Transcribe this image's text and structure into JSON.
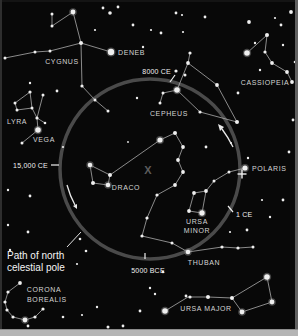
{
  "figure": {
    "kind": "precession-star-map",
    "colors": {
      "background": "#080808",
      "star": "#efefef",
      "line": "#b9b9b9",
      "circle": "#4a4a4a",
      "arrow": "#e8e8e8",
      "pointer": "#e0e0e0",
      "frame_top": "#141414",
      "frame_left": "#2e2e2e",
      "frame_right": "#606060",
      "frame_bottom": "#b5b5b5",
      "frame_bottom_line": "#8c8c8c"
    },
    "pole_circle": {
      "cx": 150,
      "cy": 169,
      "r": 90,
      "stroke_width": 3.5
    },
    "center_mark": {
      "text": "X",
      "x": 148,
      "y": 174
    },
    "polaris_marker": {
      "x": 242,
      "y": 174,
      "arm": 4.5
    },
    "path_label": {
      "line1": "Path of north",
      "line2": "celestial pole",
      "x": 7,
      "y1": 259,
      "y2": 271,
      "pointer": [
        67,
        247,
        81,
        232
      ]
    },
    "date_markers": [
      {
        "label": "8000 CE",
        "x": 171,
        "y": 74,
        "anchor": "end",
        "dot": [
          176,
          71
        ],
        "tick": [
          175,
          75,
          170,
          82
        ]
      },
      {
        "label": "15,000 CE",
        "x": 48,
        "y": 168,
        "anchor": "end",
        "tick": [
          51,
          165,
          59,
          165
        ]
      },
      {
        "label": "1 CE",
        "x": 236,
        "y": 217,
        "anchor": "start",
        "tick": [
          228,
          206,
          233,
          212
        ]
      },
      {
        "label": "5000 BCE",
        "x": 148,
        "y": 273,
        "anchor": "middle",
        "tick": [
          145,
          253,
          145,
          259
        ]
      }
    ],
    "arrows": [
      {
        "shaft": "M67,185 Q70,196 75,205",
        "head": "77,209 77,204 73,206"
      },
      {
        "shaft": "M233,147 Q228,137 222,129",
        "head": "218,124 224,127 220,131"
      }
    ],
    "constellations": [
      {
        "id": "cygnus",
        "labels": [
          {
            "text": "CYGNUS",
            "x": 62,
            "y": 64,
            "anchor": "middle"
          },
          {
            "text": "DENEB",
            "x": 118,
            "y": 55,
            "anchor": "start"
          }
        ],
        "stars": [
          [
            73,
            12,
            2.4
          ],
          [
            52,
            14,
            1.5
          ],
          [
            52,
            26,
            1.5
          ],
          [
            81,
            43,
            2.0
          ],
          [
            111,
            52,
            3.2
          ],
          [
            50,
            51,
            1.5
          ],
          [
            35,
            52,
            1.5
          ],
          [
            5,
            58,
            1.5
          ],
          [
            82,
            86,
            1.6
          ],
          [
            95,
            100,
            1.5
          ],
          [
            108,
            111,
            1.5
          ]
        ],
        "paths": [
          [
            [
              52,
              14
            ],
            [
              52,
              26
            ],
            [
              73,
              12
            ],
            [
              81,
              43
            ],
            [
              111,
              52
            ]
          ],
          [
            [
              5,
              58
            ],
            [
              35,
              52
            ],
            [
              50,
              51
            ],
            [
              81,
              43
            ]
          ],
          [
            [
              81,
              43
            ],
            [
              82,
              86
            ],
            [
              95,
              100
            ],
            [
              108,
              111
            ]
          ]
        ]
      },
      {
        "id": "lyra",
        "labels": [
          {
            "text": "LYRA",
            "x": 17,
            "y": 124,
            "anchor": "middle"
          },
          {
            "text": "VEGA",
            "x": 44,
            "y": 142,
            "anchor": "middle"
          }
        ],
        "stars": [
          [
            30,
            92,
            1.6
          ],
          [
            43,
            95,
            1.5
          ],
          [
            15,
            103,
            1.5
          ],
          [
            17,
            110,
            1.5
          ],
          [
            32,
            108,
            1.5
          ],
          [
            37,
            118,
            1.6
          ],
          [
            45,
            123,
            1.3
          ],
          [
            38,
            130,
            2.8
          ],
          [
            22,
            143,
            1.5
          ]
        ],
        "paths": [
          [
            [
              30,
              92
            ],
            [
              15,
              103
            ],
            [
              17,
              110
            ],
            [
              32,
              108
            ],
            [
              30,
              92
            ]
          ],
          [
            [
              32,
              108
            ],
            [
              37,
              118
            ],
            [
              38,
              130
            ],
            [
              22,
              143
            ]
          ],
          [
            [
              37,
              118
            ],
            [
              45,
              123
            ]
          ],
          [
            [
              43,
              95
            ],
            [
              37,
              118
            ]
          ]
        ]
      },
      {
        "id": "cassiopeia",
        "labels": [
          {
            "text": "CASSIOPEIA",
            "x": 265,
            "y": 85,
            "anchor": "middle"
          }
        ],
        "stars": [
          [
            247,
            53,
            2.8
          ],
          [
            267,
            35,
            2.0
          ],
          [
            265,
            52,
            1.6
          ],
          [
            272,
            63,
            1.9
          ],
          [
            287,
            72,
            1.9
          ],
          [
            292,
            82,
            1.9
          ]
        ],
        "paths": [
          [
            [
              247,
              53
            ],
            [
              267,
              35
            ],
            [
              265,
              52
            ],
            [
              272,
              63
            ],
            [
              287,
              72
            ],
            [
              292,
              82
            ]
          ]
        ]
      },
      {
        "id": "cepheus",
        "labels": [
          {
            "text": "CEPHEUS",
            "x": 169,
            "y": 116,
            "anchor": "middle"
          }
        ],
        "stars": [
          [
            190,
            53,
            1.6
          ],
          [
            188,
            63,
            1.9
          ],
          [
            185,
            75,
            1.5
          ],
          [
            177,
            90,
            2.8
          ],
          [
            217,
            85,
            1.9
          ],
          [
            237,
            122,
            2.0
          ],
          [
            200,
            112,
            1.6
          ],
          [
            163,
            93,
            1.5
          ],
          [
            160,
            103,
            1.5
          ]
        ],
        "paths": [
          [
            [
              190,
              53
            ],
            [
              188,
              63
            ]
          ],
          [
            [
              188,
              63
            ],
            [
              177,
              90
            ],
            [
              200,
              112
            ],
            [
              237,
              122
            ],
            [
              217,
              85
            ],
            [
              188,
              63
            ]
          ],
          [
            [
              177,
              90
            ],
            [
              163,
              93
            ],
            [
              160,
              103
            ]
          ]
        ]
      },
      {
        "id": "draco",
        "labels": [
          {
            "text": "DRACO",
            "x": 126,
            "y": 190,
            "anchor": "middle"
          },
          {
            "text": "THUBAN",
            "x": 204,
            "y": 265,
            "anchor": "middle"
          }
        ],
        "stars": [
          [
            90,
            165,
            2.3
          ],
          [
            110,
            175,
            2.0
          ],
          [
            108,
            185,
            2.3
          ],
          [
            93,
            183,
            2.0
          ],
          [
            160,
            140,
            2.6
          ],
          [
            175,
            133,
            2.0
          ],
          [
            183,
            147,
            1.9
          ],
          [
            178,
            160,
            1.9
          ],
          [
            183,
            172,
            1.9
          ],
          [
            175,
            185,
            1.9
          ],
          [
            157,
            195,
            1.6
          ],
          [
            147,
            218,
            1.6
          ],
          [
            142,
            236,
            1.6
          ],
          [
            172,
            243,
            1.5
          ],
          [
            188,
            252,
            2.3
          ],
          [
            222,
            247,
            1.6
          ],
          [
            238,
            248,
            1.6
          ],
          [
            253,
            247,
            1.5
          ]
        ],
        "paths": [
          [
            [
              90,
              165
            ],
            [
              110,
              175
            ],
            [
              108,
              185
            ],
            [
              93,
              183
            ],
            [
              90,
              165
            ]
          ],
          [
            [
              110,
              175
            ],
            [
              160,
              140
            ],
            [
              175,
              133
            ],
            [
              183,
              147
            ],
            [
              178,
              160
            ],
            [
              183,
              172
            ],
            [
              175,
              185
            ],
            [
              157,
              195
            ],
            [
              147,
              218
            ],
            [
              142,
              236
            ],
            [
              172,
              243
            ],
            [
              188,
              252
            ],
            [
              222,
              247
            ],
            [
              238,
              248
            ],
            [
              253,
              247
            ]
          ]
        ]
      },
      {
        "id": "ursa-minor",
        "labels": [
          {
            "text": "URSA",
            "x": 197,
            "y": 224,
            "anchor": "middle"
          },
          {
            "text": "MINOR",
            "x": 197,
            "y": 233,
            "anchor": "middle"
          },
          {
            "text": "POLARIS",
            "x": 252,
            "y": 171,
            "anchor": "start"
          }
        ],
        "stars": [
          [
            245,
            168,
            2.6
          ],
          [
            229,
            172,
            1.5
          ],
          [
            214,
            181,
            1.5
          ],
          [
            206,
            191,
            1.9
          ],
          [
            194,
            193,
            1.9
          ],
          [
            189,
            211,
            1.9
          ],
          [
            202,
            213,
            2.7
          ]
        ],
        "paths": [
          [
            [
              245,
              168
            ],
            [
              229,
              172
            ],
            [
              214,
              181
            ],
            [
              206,
              191
            ],
            [
              194,
              193
            ],
            [
              189,
              211
            ],
            [
              202,
              213
            ],
            [
              206,
              191
            ]
          ]
        ]
      },
      {
        "id": "ursa-major",
        "labels": [
          {
            "text": "URSA MAJOR",
            "x": 206,
            "y": 311,
            "anchor": "middle"
          }
        ],
        "stars": [
          [
            165,
            311,
            2.8
          ],
          [
            186,
            296,
            1.4
          ],
          [
            190,
            297,
            1.6
          ],
          [
            208,
            297,
            2.0
          ],
          [
            232,
            298,
            2.0
          ],
          [
            267,
            277,
            2.8
          ],
          [
            272,
            302,
            2.4
          ],
          [
            242,
            312,
            2.4
          ]
        ],
        "paths": [
          [
            [
              165,
              311
            ],
            [
              188,
              297
            ],
            [
              208,
              297
            ],
            [
              232,
              298
            ],
            [
              267,
              277
            ],
            [
              272,
              302
            ],
            [
              242,
              312
            ],
            [
              232,
              298
            ]
          ]
        ]
      },
      {
        "id": "corona-borealis",
        "labels": [
          {
            "text": "CORONA",
            "x": 44,
            "y": 292,
            "anchor": "middle"
          },
          {
            "text": "BOREALIS",
            "x": 47,
            "y": 302,
            "anchor": "middle"
          }
        ],
        "stars": [
          [
            20,
            283,
            1.9
          ],
          [
            8,
            292,
            1.6
          ],
          [
            5,
            302,
            1.6
          ],
          [
            7,
            310,
            1.6
          ],
          [
            13,
            317,
            1.6
          ],
          [
            25,
            320,
            2.4
          ],
          [
            35,
            317,
            1.6
          ],
          [
            43,
            309,
            1.6
          ]
        ],
        "paths": [
          [
            [
              20,
              283
            ],
            [
              8,
              292
            ],
            [
              5,
              302
            ],
            [
              7,
              310
            ],
            [
              13,
              317
            ],
            [
              25,
              320
            ],
            [
              35,
              317
            ],
            [
              43,
              309
            ]
          ]
        ]
      }
    ],
    "field_stars": [
      [
        103,
        8,
        1.4
      ],
      [
        110,
        13,
        1.8
      ],
      [
        118,
        7,
        1.4
      ],
      [
        95,
        30,
        1.1
      ],
      [
        133,
        25,
        1.4
      ],
      [
        143,
        47,
        1.2
      ],
      [
        151,
        30,
        1.1
      ],
      [
        161,
        33,
        1.4
      ],
      [
        176,
        13,
        1.4
      ],
      [
        182,
        15,
        1.1
      ],
      [
        183,
        32,
        1.1
      ],
      [
        205,
        17,
        1.4
      ],
      [
        249,
        22,
        1.9
      ],
      [
        291,
        12,
        1.9
      ],
      [
        275,
        18,
        1.1
      ],
      [
        281,
        25,
        1.4
      ],
      [
        295,
        62,
        1.3
      ],
      [
        283,
        45,
        1.2
      ],
      [
        255,
        43,
        1.2
      ],
      [
        260,
        70,
        1.2
      ],
      [
        238,
        93,
        1.4
      ],
      [
        293,
        120,
        1.4
      ],
      [
        289,
        152,
        1.4
      ],
      [
        283,
        200,
        1.4
      ],
      [
        270,
        217,
        1.2
      ],
      [
        262,
        200,
        1.1
      ],
      [
        247,
        230,
        1.4
      ],
      [
        230,
        232,
        1.1
      ],
      [
        206,
        147,
        1.4
      ],
      [
        231,
        143,
        1.1
      ],
      [
        248,
        158,
        1.2
      ],
      [
        137,
        98,
        1.2
      ],
      [
        128,
        142,
        0.9
      ],
      [
        30,
        83,
        1.2
      ],
      [
        57,
        91,
        1.4
      ],
      [
        63,
        147,
        1.1
      ],
      [
        8,
        190,
        1.2
      ],
      [
        30,
        196,
        1.4
      ],
      [
        8,
        225,
        1.2
      ],
      [
        28,
        232,
        1.4
      ],
      [
        10,
        250,
        1.2
      ],
      [
        80,
        239,
        1.3
      ],
      [
        86,
        251,
        1.3
      ],
      [
        77,
        264,
        1.1
      ],
      [
        63,
        317,
        1.3
      ],
      [
        28,
        326,
        1.4
      ],
      [
        97,
        307,
        1.2
      ],
      [
        108,
        327,
        1.5
      ],
      [
        123,
        326,
        1.4
      ],
      [
        140,
        311,
        1.4
      ],
      [
        150,
        288,
        1.2
      ],
      [
        155,
        294,
        1.2
      ],
      [
        163,
        272,
        1.3
      ],
      [
        82,
        315,
        1.1
      ]
    ]
  }
}
